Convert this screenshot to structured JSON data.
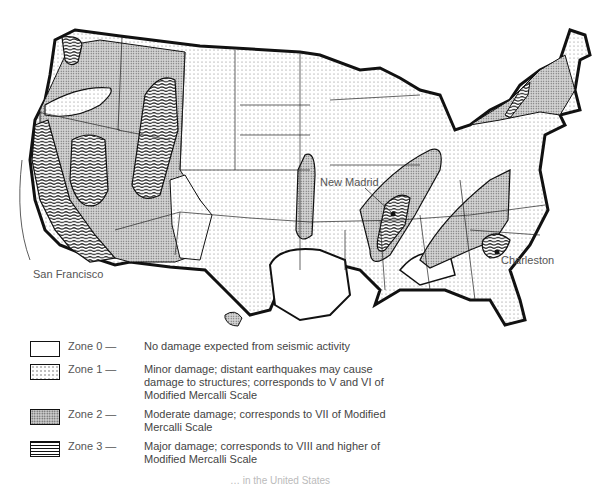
{
  "map": {
    "type": "seismic risk zone map",
    "region": "Contiguous United States",
    "labels": {
      "san_francisco": "San Francisco",
      "new_madrid": "New Madrid",
      "charleston": "Charleston"
    },
    "colors": {
      "outline": "#111111",
      "zone0": "#ffffff",
      "zone1": "#f4f4f4",
      "zone2": "#cfcfcf",
      "zone3": "#111111"
    }
  },
  "legend": {
    "items": [
      {
        "zone": "Zone 0 —",
        "description": "No damage expected from seismic activity",
        "pattern": "blank"
      },
      {
        "zone": "Zone 1 —",
        "description": "Minor damage; distant earthquakes may cause damage to structures; corresponds to V and VI of Modified Mercalli Scale",
        "pattern": "sparse-dots"
      },
      {
        "zone": "Zone 2 —",
        "description": "Moderate damage; corresponds to VII of Modified Mercalli Scale",
        "pattern": "dense-dots"
      },
      {
        "zone": "Zone 3 —",
        "description": "Major damage; corresponds to VIII and higher of Modified Mercalli Scale",
        "pattern": "wavy-lines"
      }
    ]
  },
  "caption": {
    "text": "… in the United States"
  }
}
